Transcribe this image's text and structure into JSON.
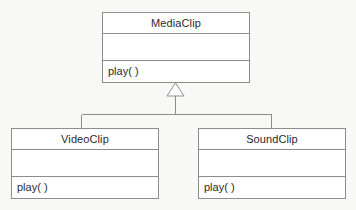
{
  "diagram": {
    "type": "uml-class-diagram",
    "background_color": "#f8f8f6",
    "line_color": "#8d8d8d",
    "text_color": "#2a2a2a",
    "fill_color": "#ffffff"
  },
  "classes": {
    "parent": {
      "name": "MediaClip",
      "attributes": "",
      "operations": "play( )"
    },
    "child_left": {
      "name": "VideoClip",
      "attributes": "",
      "operations": "play( )"
    },
    "child_right": {
      "name": "SoundClip",
      "attributes": "",
      "operations": "play( )"
    }
  },
  "relationship": {
    "kind": "generalization",
    "arrow": "hollow-triangle",
    "from": [
      "VideoClip",
      "SoundClip"
    ],
    "to": "MediaClip"
  }
}
